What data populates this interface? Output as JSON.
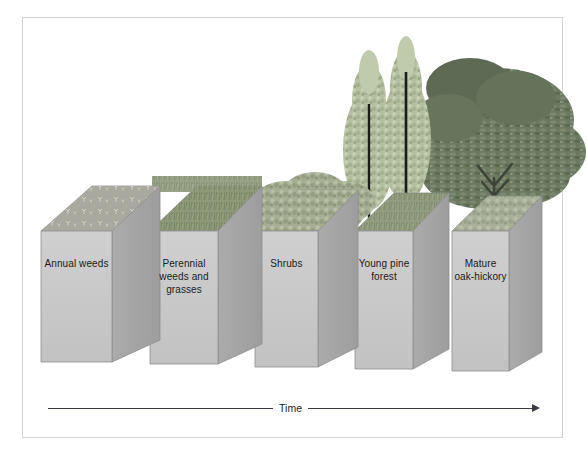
{
  "figure": {
    "frame_color": "#d2d2d2",
    "background": "#ffffff"
  },
  "palette": {
    "block_front": "#c9c9c9",
    "block_side": "#a9a9a9",
    "block_top": "#b4b4b4",
    "block_outline": "#8e8e8e",
    "weed_green": "#9aa48c",
    "grass_green": "#8e9a7a",
    "shrub_green": "#a8b095",
    "pine_foliage": "#b9c4a4",
    "pine_trunk": "#1c1c1c",
    "oak_canopy": "#6d7a62",
    "oak_canopy_dark": "#57634e",
    "axis_color": "#3a3a44",
    "text_color": "#1b1b1b"
  },
  "stages": [
    {
      "id": "annual-weeds",
      "label": "Annual weeds",
      "vegetation": "sparse-seedlings",
      "order": 1
    },
    {
      "id": "perennial-weeds-grasses",
      "label": "Perennial\nweeds and\ngrasses",
      "vegetation": "tall-grass",
      "order": 2
    },
    {
      "id": "shrubs",
      "label": "Shrubs",
      "vegetation": "shrub-mass",
      "order": 3
    },
    {
      "id": "young-pine-forest",
      "label": "Young pine\nforest",
      "vegetation": "pine-trees",
      "order": 4
    },
    {
      "id": "mature-oak-hickory",
      "label": "Mature\noak-hickory",
      "vegetation": "oak-canopy",
      "order": 5
    }
  ],
  "axis": {
    "label": "Time",
    "direction": "left-to-right",
    "arrowhead": "right"
  }
}
